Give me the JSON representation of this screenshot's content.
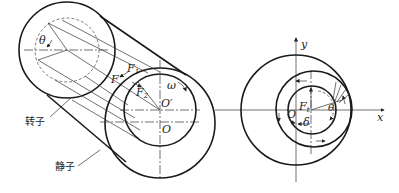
{
  "figure_left": {
    "title": "rotor-stator 3D view",
    "labels": {
      "theta": "θ",
      "F1_base": "F",
      "F1_sub": "1",
      "F": "F",
      "F2_base": "F",
      "F2_sub": "2",
      "omega": "ω",
      "O_prime": "O′",
      "O": "O",
      "rotor": "转子",
      "stator": "静子"
    }
  },
  "figure_right": {
    "title": "cross-section view",
    "labels": {
      "y_axis": "y",
      "x_axis": "x",
      "Ft_base": "F",
      "Ft_sub": "t",
      "O": "O",
      "delta": "δ",
      "theta": "θ"
    }
  },
  "colors": {
    "stroke": "#1a1a1a",
    "background": "#ffffff"
  }
}
